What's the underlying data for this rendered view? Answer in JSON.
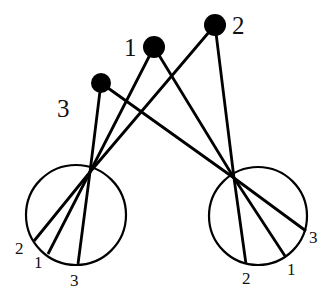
{
  "diagram": {
    "colors": {
      "stroke": "#000000",
      "text": "#111111",
      "background": "#ffffff"
    },
    "sources": [
      {
        "id": "1",
        "label": "1",
        "cx": 154,
        "cy": 47,
        "r": 11,
        "label_x": 124,
        "label_y": 56
      },
      {
        "id": "2",
        "label": "2",
        "cx": 215,
        "cy": 25,
        "r": 11,
        "label_x": 232,
        "label_y": 34
      },
      {
        "id": "3",
        "label": "3",
        "cx": 101,
        "cy": 83,
        "r": 10,
        "label_x": 57,
        "label_y": 117
      }
    ],
    "screens": [
      {
        "id": "left",
        "cx": 76,
        "cy": 215,
        "r": 50,
        "pinhole": {
          "x": 90,
          "y": 172
        },
        "points": [
          {
            "source": "2",
            "label": "2",
            "x": 34,
            "y": 241,
            "label_x": 15,
            "label_y": 254
          },
          {
            "source": "1",
            "label": "1",
            "x": 48,
            "y": 254,
            "label_x": 34,
            "label_y": 268
          },
          {
            "source": "3",
            "label": "3",
            "x": 78,
            "y": 264,
            "label_x": 70,
            "label_y": 286
          }
        ]
      },
      {
        "id": "right",
        "cx": 258,
        "cy": 216,
        "r": 49,
        "pinhole": {
          "x": 234,
          "y": 178
        },
        "points": [
          {
            "source": "2",
            "label": "2",
            "x": 246,
            "y": 264,
            "label_x": 242,
            "label_y": 284
          },
          {
            "source": "1",
            "label": "1",
            "x": 285,
            "y": 256,
            "label_x": 287,
            "label_y": 275
          },
          {
            "source": "3",
            "label": "3",
            "x": 306,
            "y": 231,
            "label_x": 309,
            "label_y": 243
          }
        ]
      }
    ]
  }
}
